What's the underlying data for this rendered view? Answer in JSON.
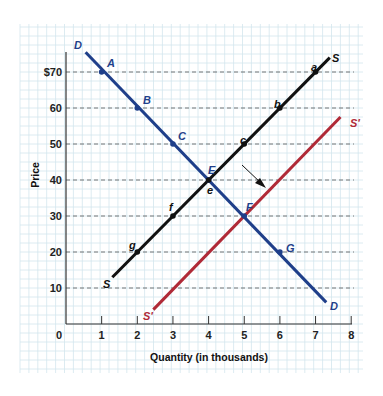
{
  "colors": {
    "demand": "#1f3f8a",
    "supply": "#111111",
    "new_supply": "#b02a37",
    "grid": "#d3e6ee",
    "dashed": "#555555",
    "axis": "#333333"
  },
  "axes": {
    "x_title": "Quantity (in thousands)",
    "y_title": "Price",
    "origin_label": "0",
    "x_ticks": [
      "1",
      "2",
      "3",
      "4",
      "5",
      "6",
      "7",
      "8"
    ],
    "y_ticks": [
      "10",
      "20",
      "30",
      "40",
      "50",
      "60",
      "$70"
    ]
  },
  "chart_data": {
    "type": "line",
    "title": "",
    "xlabel": "Quantity (in thousands)",
    "ylabel": "Price",
    "xlim": [
      0,
      8
    ],
    "ylim": [
      0,
      80
    ],
    "x_ticks": [
      1,
      2,
      3,
      4,
      5,
      6,
      7,
      8
    ],
    "y_ticks": [
      10,
      20,
      30,
      40,
      50,
      60,
      70
    ],
    "y_tick_labels": [
      "10",
      "20",
      "30",
      "40",
      "50",
      "60",
      "$70"
    ],
    "grid": true,
    "dashed_reference_lines_y": [
      10,
      20,
      30,
      40,
      50,
      60,
      70
    ],
    "series": [
      {
        "name": "D",
        "label": "Demand",
        "line": [
          [
            0.55,
            75.5
          ],
          [
            7.3,
            6
          ]
        ],
        "points": [
          {
            "label": "A",
            "x": 1,
            "y": 70
          },
          {
            "label": "B",
            "x": 2,
            "y": 60
          },
          {
            "label": "C",
            "x": 3,
            "y": 50
          },
          {
            "label": "E",
            "x": 4,
            "y": 40
          },
          {
            "label": "F",
            "x": 5,
            "y": 30
          },
          {
            "label": "G",
            "x": 6,
            "y": 20
          }
        ]
      },
      {
        "name": "S",
        "label": "Supply",
        "line": [
          [
            1.3,
            13
          ],
          [
            7.4,
            74
          ]
        ],
        "points": [
          {
            "label": "g",
            "x": 2,
            "y": 20
          },
          {
            "label": "f",
            "x": 3,
            "y": 30
          },
          {
            "label": "e",
            "x": 4,
            "y": 40
          },
          {
            "label": "c",
            "x": 5,
            "y": 50
          },
          {
            "label": "b",
            "x": 6,
            "y": 60
          },
          {
            "label": "a",
            "x": 7,
            "y": 70
          }
        ]
      },
      {
        "name": "S'",
        "label": "New Supply",
        "line": [
          [
            2.45,
            4
          ],
          [
            7.7,
            57.5
          ]
        ],
        "points": []
      }
    ],
    "annotations": [
      {
        "type": "arrow",
        "from": [
          4.9,
          44
        ],
        "to": [
          5.6,
          37.5
        ],
        "meaning": "supply shift rightward"
      }
    ],
    "equilibria": [
      {
        "label": "E",
        "x": 4,
        "y": 40,
        "curves": [
          "D",
          "S"
        ]
      },
      {
        "label": "F",
        "x": 5,
        "y": 30,
        "curves": [
          "D",
          "S'"
        ]
      }
    ]
  },
  "labels": {
    "demand_top": "D",
    "demand_bottom": "D",
    "supply_top": "S",
    "supply_bottom": "S",
    "new_supply_top": "S'",
    "new_supply_bottom": "S'",
    "A": "A",
    "B": "B",
    "C": "C",
    "E": "E",
    "F": "F",
    "G": "G",
    "a": "a",
    "b": "b",
    "c": "c",
    "e": "e",
    "f": "f",
    "g": "g"
  }
}
